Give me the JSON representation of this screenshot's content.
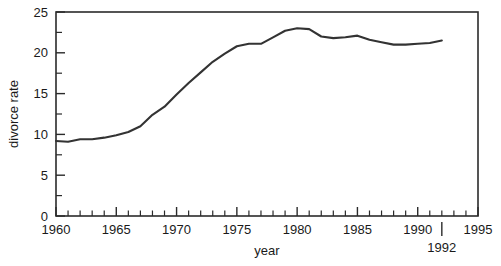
{
  "chart_data": {
    "type": "line",
    "title": "",
    "subtitle": "",
    "xlabel": "year",
    "ylabel": "divorce rate",
    "xlim": [
      1960,
      1995
    ],
    "ylim": [
      0,
      25
    ],
    "grid": false,
    "legend": false,
    "legend_position": "none",
    "x_major_ticks": [
      1960,
      1965,
      1970,
      1975,
      1980,
      1985,
      1990,
      1995
    ],
    "x_major_tick_labels": [
      "1960",
      "1965",
      "1970",
      "1975",
      "1980",
      "1985",
      "1990",
      "1995"
    ],
    "x_minor_tick_step": 1,
    "y_major_ticks": [
      0,
      5,
      10,
      15,
      20,
      25
    ],
    "y_major_tick_labels": [
      "0",
      "5",
      "10",
      "15",
      "20",
      "25"
    ],
    "y_minor_ticks": [
      2.5,
      7.5,
      12.5,
      17.5,
      22.5
    ],
    "line_color": "#333333",
    "annotations": [
      {
        "name": "endpoint-year-callout",
        "label": "1992",
        "x": 1992,
        "note": "extra tick and label placed below the axis row"
      }
    ],
    "x": [
      1960,
      1961,
      1962,
      1963,
      1964,
      1965,
      1966,
      1967,
      1968,
      1969,
      1970,
      1971,
      1972,
      1973,
      1974,
      1975,
      1976,
      1977,
      1978,
      1979,
      1980,
      1981,
      1982,
      1983,
      1984,
      1985,
      1986,
      1987,
      1988,
      1989,
      1990,
      1991,
      1992
    ],
    "values": [
      9.2,
      9.1,
      9.4,
      9.4,
      9.6,
      9.9,
      10.3,
      11.0,
      12.4,
      13.4,
      14.9,
      16.3,
      17.6,
      18.9,
      19.9,
      20.8,
      21.1,
      21.1,
      21.9,
      22.7,
      23.0,
      22.9,
      22.0,
      21.8,
      21.9,
      22.1,
      21.6,
      21.3,
      21.0,
      21.0,
      21.1,
      21.2,
      21.5
    ],
    "series": [
      {
        "name": "divorce rate",
        "values": [
          9.2,
          9.1,
          9.4,
          9.4,
          9.6,
          9.9,
          10.3,
          11.0,
          12.4,
          13.4,
          14.9,
          16.3,
          17.6,
          18.9,
          19.9,
          20.8,
          21.1,
          21.1,
          21.9,
          22.7,
          23.0,
          22.9,
          22.0,
          21.8,
          21.9,
          22.1,
          21.6,
          21.3,
          21.0,
          21.0,
          21.1,
          21.2,
          21.5
        ]
      }
    ]
  }
}
